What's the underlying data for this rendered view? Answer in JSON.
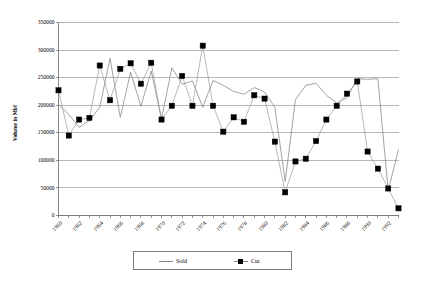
{
  "chart_data": {
    "type": "line",
    "title": "",
    "xlabel": "",
    "ylabel": "Volume in Mbf",
    "ylim": [
      0,
      350000
    ],
    "ytick_step": 50000,
    "yticks": [
      "0",
      "50000",
      "100000",
      "150000",
      "200000",
      "250000",
      "300000",
      "350000"
    ],
    "grid": true,
    "legend_position": "bottom-center",
    "x": [
      1960,
      1961,
      1962,
      1963,
      1964,
      1965,
      1966,
      1967,
      1968,
      1969,
      1970,
      1971,
      1972,
      1973,
      1974,
      1975,
      1976,
      1977,
      1978,
      1979,
      1980,
      1981,
      1982,
      1983,
      1984,
      1985,
      1986,
      1987,
      1988,
      1989,
      1990,
      1991,
      1992,
      1993
    ],
    "xtick_labels": [
      "1960",
      "1962",
      "1964",
      "1966",
      "1968",
      "1970",
      "1972",
      "1974",
      "1976",
      "1978",
      "1980",
      "1982",
      "1984",
      "1986",
      "1988",
      "1990",
      "1992"
    ],
    "xtick_label_step": 2,
    "xtick_rotation": -45,
    "series": [
      {
        "name": "Sold",
        "marker": "none",
        "color": "#8a8a8a",
        "values": [
          202000,
          183000,
          160000,
          172000,
          196000,
          285000,
          178000,
          260000,
          198000,
          262000,
          175000,
          268000,
          238000,
          244000,
          196000,
          245000,
          236000,
          225000,
          220000,
          232000,
          224000,
          196000,
          62000,
          210000,
          236000,
          240000,
          218000,
          204000,
          214000,
          248000,
          247000,
          248000,
          45000,
          120000
        ]
      },
      {
        "name": "Cut",
        "marker": "square",
        "color": "#000000",
        "values": [
          227000,
          145000,
          174000,
          177000,
          272000,
          209000,
          266000,
          276000,
          239000,
          277000,
          174000,
          199000,
          253000,
          199000,
          308000,
          199000,
          152000,
          178000,
          170000,
          218000,
          212000,
          134000,
          42000,
          98000,
          103000,
          135000,
          174000,
          199000,
          221000,
          243000,
          116000,
          85000,
          49000,
          13000
        ]
      }
    ]
  },
  "legend": {
    "entries": [
      {
        "label": "Sold",
        "swatch": "line"
      },
      {
        "label": "Cut",
        "swatch": "marker"
      }
    ]
  },
  "axes": {
    "y_title": "Volume in Mbf"
  }
}
